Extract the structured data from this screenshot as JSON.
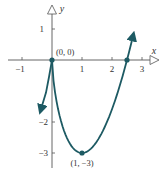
{
  "chart_data": {
    "type": "line",
    "title": "",
    "function": "f(x) = 2x^(5/3) - 5x^(2/3)",
    "xlabel": "x",
    "ylabel": "y",
    "xlim": [
      -1.5,
      3.5
    ],
    "ylim": [
      -3.5,
      1.8
    ],
    "grid": false,
    "x_ticks": [
      -1,
      1,
      2,
      3
    ],
    "x_tick_labels": [
      "−1",
      "1",
      "2",
      "3"
    ],
    "y_ticks": [
      1,
      -2,
      -3
    ],
    "y_tick_labels": [
      "1",
      "−2",
      "−3"
    ],
    "series": [
      {
        "name": "f(x)",
        "x": [
          -0.37,
          -0.2,
          -0.1,
          0,
          0.1,
          0.25,
          0.5,
          0.75,
          1,
          1.25,
          1.5,
          1.75,
          2,
          2.25,
          2.5,
          2.7
        ],
        "y": [
          -1.6,
          -1.05,
          -0.55,
          0,
          -1.0,
          -1.85,
          -2.52,
          -2.85,
          -3,
          -2.93,
          -2.62,
          -2.08,
          -1.26,
          -0.27,
          0,
          0.95
        ]
      }
    ],
    "marked_points": [
      {
        "x": 0,
        "y": 0,
        "label": "(0, 0)"
      },
      {
        "x": 1,
        "y": -3,
        "label": "(1, −3)"
      },
      {
        "x": 2.5,
        "y": 0,
        "label": ""
      }
    ],
    "color": "#1d5a63"
  }
}
